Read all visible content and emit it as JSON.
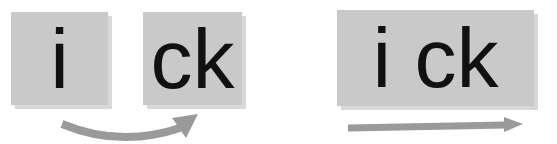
{
  "diagram": {
    "left_group": {
      "box1_text": "i",
      "box2_text": "ck",
      "arrow": {
        "type": "curved",
        "direction": "right",
        "color": "#9a9a9a"
      }
    },
    "right_group": {
      "box_text": "i ck",
      "arrow": {
        "type": "straight",
        "direction": "right",
        "color": "#9a9a9a"
      }
    },
    "colors": {
      "box_fill": "#c9c9c9",
      "box_shadow": "#d8d8d8",
      "text": "#111111"
    }
  }
}
